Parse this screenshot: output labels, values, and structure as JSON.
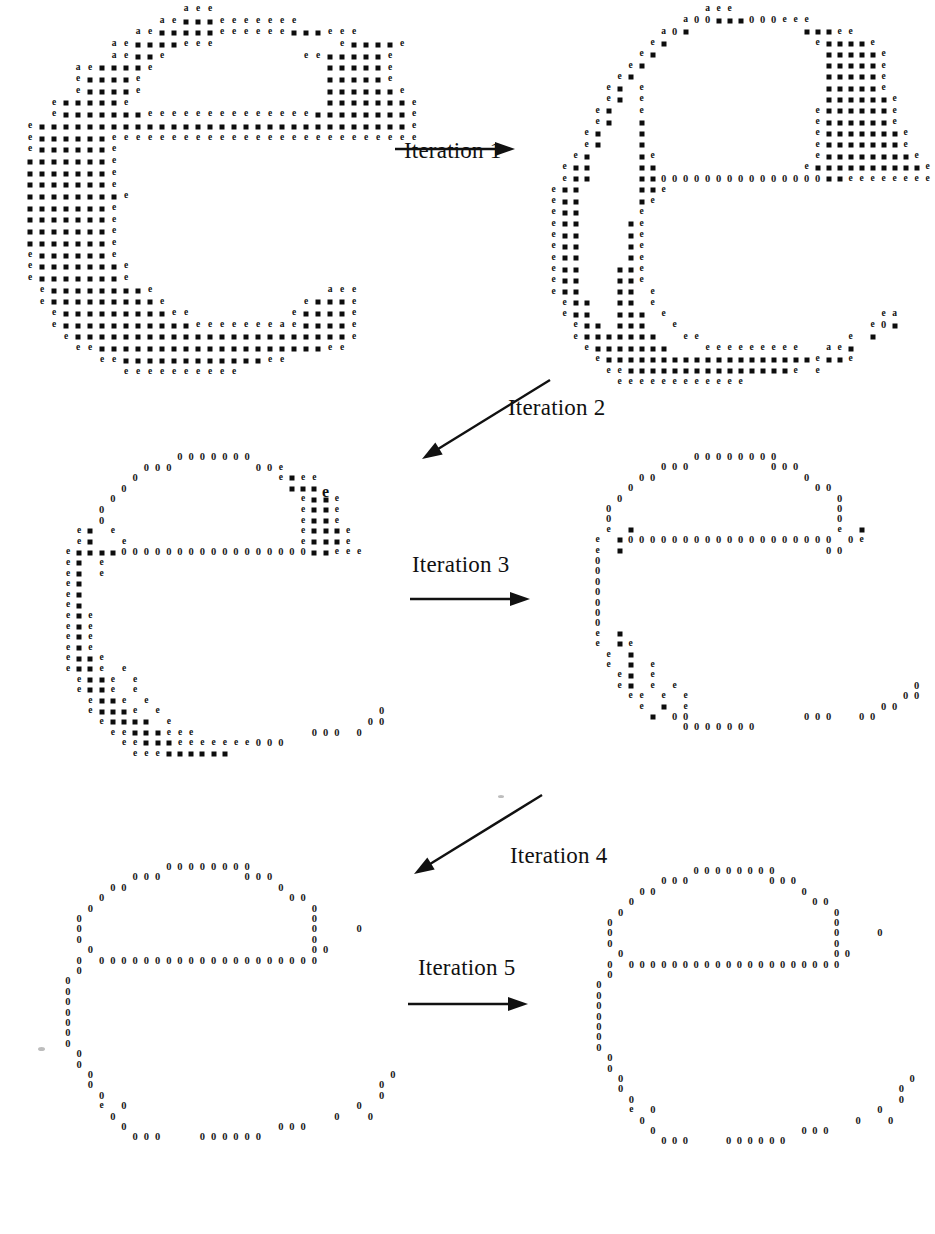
{
  "figure": {
    "background_color": "#ffffff",
    "ink_color": "#111111",
    "glyph_legend": {
      "a": "a",
      "e": "e",
      "z": "0",
      "s": "■"
    },
    "glyph_meaning": {
      "a": "boundary-a pixel",
      "e": "edge pixel",
      "z": "zero / removed pixel",
      "s": "filled interior pixel"
    }
  },
  "arrows": [
    {
      "id": "iteration-1",
      "label": "Iteration 1",
      "direction": "right",
      "x": 395,
      "y": 140,
      "length": 120,
      "label_x": 404,
      "label_y": 138
    },
    {
      "id": "iteration-2",
      "label": "Iteration 2",
      "direction": "down-left",
      "x": 420,
      "y": 380,
      "length": 130,
      "label_x": 508,
      "label_y": 395
    },
    {
      "id": "iteration-3",
      "label": "Iteration 3",
      "direction": "right",
      "x": 410,
      "y": 590,
      "length": 120,
      "label_x": 412,
      "label_y": 552
    },
    {
      "id": "iteration-4",
      "label": "Iteration 4",
      "direction": "down-left",
      "x": 412,
      "y": 795,
      "length": 130,
      "label_x": 510,
      "label_y": 843
    },
    {
      "id": "iteration-5",
      "label": "Iteration 5",
      "direction": "right",
      "x": 408,
      "y": 995,
      "length": 120,
      "label_x": 418,
      "label_y": 955
    }
  ],
  "bottom_cropped_text": "Fig. Successive thinning of the shape \"C\".  ⓘ",
  "panels": [
    {
      "id": "panel-0",
      "caption": "Original shape",
      "x": 0,
      "y": 4,
      "cell_w": 12.0,
      "cell_h": 11.7,
      "rows": [
        "...............aee.................",
        ".............aessseeeeeee..........",
        "...........aessssseeeeeessseee.....",
        ".........aesssseee..........esssse.",
        ".........aesse...........eessssse..",
        "......aesssse..............ssssse..",
        "......esssse...............ssssse..",
        "......esssse...............sssssse.",
        "....essssse................ssssssse",
        "....essssssseeeeeeeeeeeeeesssssssse",
        "..essssssssssssssssssssssssssssssse",
        "..esssssseeeeeeeeeeeeeeeeeeeeeeeeee",
        "..esssssse.........................",
        "..ssssssse.........................",
        "..ssssssse.........................",
        "..ssssssse.........................",
        "..sssssssse........................",
        "..ssssssse.........................",
        "..ssssssse.........................",
        "..ssssssse.........................",
        "..ssssssse.........................",
        "..esssssse.........................",
        "..essssssse........................",
        "..essssssse........................",
        "...esssssssse..............aee.....",
        "...essssssssse...........essse.....",
        "....esssssssssee........esssse.....",
        "....essssssssssseeeeeeeaesssse.....",
        ".....essssssssssssssssssssssse.....",
        "......eesssssssssssssssssssee......",
        "........eessssssssssssee...........",
        "..........eeeeeeeeee..............."
      ]
    },
    {
      "id": "panel-1",
      "caption": "After iteration 1",
      "x": 548,
      "y": 4,
      "cell_w": 11.0,
      "cell_h": 11.3,
      "rows": [
        "..............aee..................",
        "............a0zsss000eee...........",
        "..........a0s..........sssee.......",
        ".........es.............esssse.....",
        "........es...............ssssse....",
        ".......es................ssssse....",
        "......es.................ssssse....",
        ".....es.e................ssssse....",
        ".....es.e................sssssse...",
        "....es..e...............esssssse...",
        "....es..s...............esssssse...",
        "...es...s...............essssssse..",
        "...es...s...............essssssse..",
        "..es....se..............esssssssse.",
        ".ess....ss.............esssssssssse",
        ".ess....ssz00000000000000sseeeeeeee",
        "ess.....sse........................",
        "ess.....se.........................",
        "ess.....e..........................",
        "ess....se..........................",
        "ess....se..........................",
        "ess....se..........................",
        "ess....se..........................",
        "ess...sse..........................",
        "ess...sse..........................",
        "ess...ss.e.........................",
        ".ess..ss.e.........................",
        ".ess..sss.e...................ea...",
        "..ess.sss..e.................e0s...",
        "..esssssss..ee.............e.s.....",
        "...esssssss...eeeeeeeee..aes.......",
        "....esssssssssssssssssssesse.......",
        ".....eessssssssssssssse.e..........",
        "......eeeeeeeeeeee................."
      ]
    },
    {
      "id": "panel-2",
      "caption": "After iteration 2",
      "x": 40,
      "y": 452,
      "cell_w": 11.2,
      "cell_h": 10.6,
      "rows": [
        "............0000000................",
        ".........000.......00e.............",
        "........0............esee..........",
        ".......0..............sssе.........",
        "......0................esse........",
        ".....0.................esse........",
        ".....0.................esse........",
        "...es.e................essse.......",
        "...es..e...............essse.......",
        "..essss00000000000000000sseee......",
        "..es.e.............................",
        "..es.e.............................",
        "..es...............................",
        "..es...............................",
        "..es...............................",
        "..ese..............................",
        "..ese..............................",
        "..ese..............................",
        "..ese..............................",
        "..esse.............................",
        "..esse.e...........................",
        "...esse.e..........................",
        "...esse.e..........................",
        "....esse.e.........................",
        "....essse.e...................0....",
        ".....essss.e.................00....",
        "......eessseee..........000.0......",
        ".......eessseeeeeee000.............",
        "........eeessssss.................."
      ]
    },
    {
      "id": "panel-3",
      "caption": "After iteration 3",
      "x": 570,
      "y": 452,
      "cell_w": 11.0,
      "cell_h": 10.4,
      "rows": [
        "...........00000000................",
        "........000.......000..............",
        "......00.............0.............",
        ".....0................00...........",
        "....0...................0..........",
        "...0....................0..........",
        "...0....................0..........",
        "...e.s..................e.s........",
        "..e.s0000000000000000000.0e........",
        "..e.s..................00..........",
        "..0................................",
        "..0................................",
        "..0................................",
        "..0................................",
        "..0................................",
        "..0................................",
        "..0................................",
        "..e.s..............................",
        "..e.se.............................",
        "...e.s.............................",
        "...e.s.e...........................",
        "....es.e...........................",
        "....es.e.e.....................0...",
        ".....ee.e.e...................00...",
        "......e.s.e.................00.....",
        ".......s.00..........000..00.......",
        "..........0000000.................."
      ]
    },
    {
      "id": "panel-4",
      "caption": "After iteration 4",
      "x": 40,
      "y": 862,
      "cell_w": 11.2,
      "cell_h": 10.4,
      "rows": [
        "...........00000000................",
        "........000.......000..............",
        "......00.............0.............",
        ".....0................00...........",
        "....0...................0..........",
        "...0....................0..........",
        "...0....................0...0......",
        "...0....................0..........",
        "....0...................00.........",
        "...0.00000000000000000000..........",
        "...0...............................",
        "..0................................",
        "..0................................",
        "..0................................",
        "..0................................",
        "..0................................",
        "..0................................",
        "..0................................",
        "...0...............................",
        "...0...............................",
        "....0..........................0...",
        "....0.........................0....",
        ".....0........................0....",
        ".....e.0....................0......",
        "......0...................0..0.....",
        ".......0.............000...........",
        "........000...000000..............."
      ]
    },
    {
      "id": "panel-5",
      "caption": "After iteration 5",
      "x": 572,
      "y": 866,
      "cell_w": 10.8,
      "cell_h": 10.4,
      "rows": [
        "...........00000000................",
        "........000.......000..............",
        "......00.............0.............",
        ".....0................00...........",
        "....0...................0..........",
        "...0....................0..........",
        "...0....................0...0......",
        "...0....................0..........",
        "....0...................00.........",
        "...0.00000000000000000000..........",
        "...0...............................",
        "..0................................",
        "..0................................",
        "..0................................",
        "..0................................",
        "..0................................",
        "..0................................",
        "..0................................",
        "...0...............................",
        "...0...............................",
        "....0..........................0...",
        "....0.........................0....",
        ".....0........................0....",
        ".....e.0....................0......",
        "......0...................0..0.....",
        ".......0.............000...........",
        "........000...000000..............."
      ]
    }
  ]
}
